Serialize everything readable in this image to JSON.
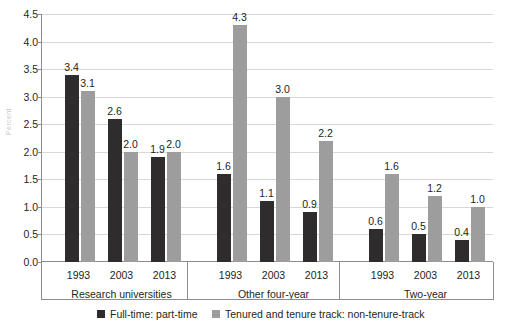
{
  "chart_data": {
    "type": "bar",
    "title": "",
    "xlabel": "",
    "ylabel": "Percent",
    "ylim": [
      0.0,
      4.5
    ],
    "ytick_labels": [
      "4.5",
      "4.0",
      "3.5",
      "3.0",
      "2.5",
      "2.0",
      "1.5",
      "1.0",
      "0.5",
      "0.0"
    ],
    "ytick_values": [
      4.5,
      4.0,
      3.5,
      3.0,
      2.5,
      2.0,
      1.5,
      1.0,
      0.5,
      0.0
    ],
    "grid": true,
    "legend_position": "bottom",
    "groups": [
      {
        "label": "Research universities",
        "categories": [
          "1993",
          "2003",
          "2013"
        ]
      },
      {
        "label": "Other four-year",
        "categories": [
          "1993",
          "2003",
          "2013"
        ]
      },
      {
        "label": "Two-year",
        "categories": [
          "1993",
          "2003",
          "2013"
        ]
      }
    ],
    "categories": [
      "1993",
      "2003",
      "2013",
      "1993",
      "2003",
      "2013",
      "1993",
      "2003",
      "2013"
    ],
    "series": [
      {
        "name": "Full-time: part-time",
        "color": "#2e2c2d",
        "values": [
          3.4,
          2.6,
          1.9,
          1.6,
          1.1,
          0.9,
          0.6,
          0.5,
          0.4
        ],
        "labels": [
          "3.4",
          "2.6",
          "1.9",
          "1.6",
          "1.1",
          "0.9",
          "0.6",
          "0.5",
          "0.4"
        ]
      },
      {
        "name": "Tenured and tenure track: non-tenure-track",
        "color": "#9d9d9d",
        "values": [
          3.1,
          2.0,
          2.0,
          4.3,
          3.0,
          2.2,
          1.6,
          1.2,
          1.0
        ],
        "labels": [
          "3.1",
          "2.0",
          "2.0",
          "4.3",
          "3.0",
          "2.2",
          "1.6",
          "1.2",
          "1.0"
        ]
      }
    ]
  },
  "legend": {
    "items": [
      {
        "label": "Full-time: part-time",
        "color": "#2e2c2d"
      },
      {
        "label": "Tenured and tenure track: non-tenure-track",
        "color": "#9d9d9d"
      }
    ]
  },
  "axis": {
    "y_title": "Percent"
  }
}
